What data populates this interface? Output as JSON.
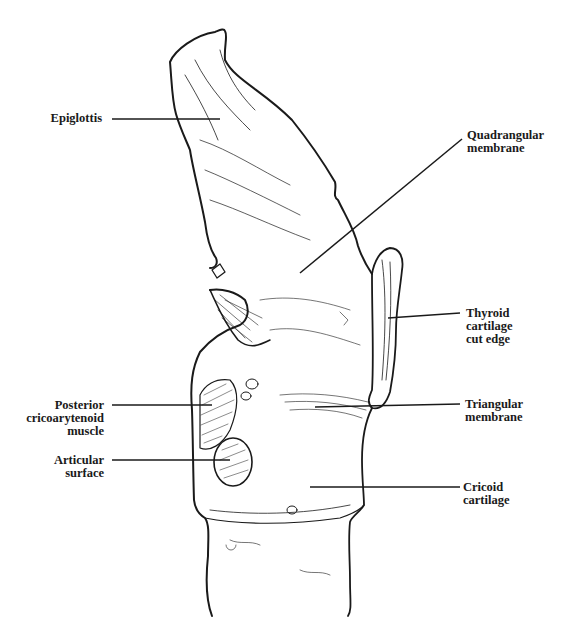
{
  "figure": {
    "colors": {
      "ink": "#1a1a1a",
      "background": "#ffffff"
    }
  },
  "labels": {
    "epiglottis": "Epiglottis",
    "quadrangular_membrane": "Quadrangular\nmembrane",
    "thyroid_cartilage_cut_edge": "Thyroid\ncartilage\ncut edge",
    "posterior_cricoarytenoid_muscle": "Posterior\ncricoarytenoid\nmuscle",
    "articular_surface": "Articular\nsurface",
    "triangular_membrane": "Triangular\nmembrane",
    "cricoid_cartilage": "Cricoid\ncartilage"
  }
}
